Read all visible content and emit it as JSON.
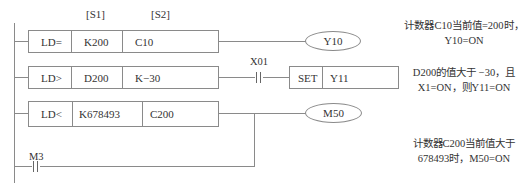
{
  "diagram": {
    "type": "PLC ladder diagram - contact comparison instructions",
    "operand_headers": {
      "s1": "[S1]",
      "s2": "[S2]"
    },
    "rungs": [
      {
        "instruction": "LD=",
        "s1": "K200",
        "s2": "C10",
        "output": "Y10",
        "note_line1": "计数器C10当前值=200时，",
        "note_line2": "Y10=ON"
      },
      {
        "instruction": "LD>",
        "s1": "D200",
        "s2": "K−30",
        "series_contact": "X01",
        "output_instruction": "SET",
        "output": "Y11",
        "note_line1": "D200的值大于 −30，且",
        "note_line2": "X1=ON，则Y11=ON"
      },
      {
        "instruction": "LD<",
        "s1": "K678493",
        "s2": "C200",
        "output": "M50",
        "parallel_contact": "M3",
        "note_line1": "计数器C200当前值大于",
        "note_line2": "678493时，M50=ON"
      }
    ]
  }
}
